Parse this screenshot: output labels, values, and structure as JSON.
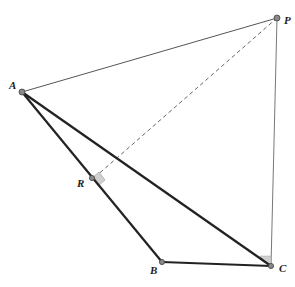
{
  "diagram": {
    "points": {
      "A": {
        "label": "A"
      },
      "B": {
        "label": "B"
      },
      "C": {
        "label": "C"
      },
      "P": {
        "label": "P"
      },
      "R": {
        "label": "R"
      }
    },
    "segments": [
      {
        "from": "A",
        "to": "P",
        "style": "thin"
      },
      {
        "from": "P",
        "to": "C",
        "style": "thin"
      },
      {
        "from": "A",
        "to": "B",
        "style": "thick"
      },
      {
        "from": "B",
        "to": "C",
        "style": "thick"
      },
      {
        "from": "A",
        "to": "C",
        "style": "thick"
      },
      {
        "from": "P",
        "to": "R",
        "style": "dashed"
      }
    ],
    "right_angles": [
      "R",
      "C"
    ],
    "colors": {
      "thick": "#222222",
      "thin": "#555555",
      "dashed": "#666666",
      "point": "#777777",
      "marker": "#d0d0d0"
    }
  }
}
